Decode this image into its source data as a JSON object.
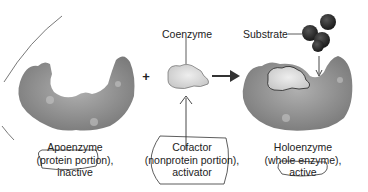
{
  "diagram": {
    "labels": {
      "coenzyme": "Coenzyme",
      "substrate": "Substrate",
      "plus": "+",
      "apoenzyme": {
        "line1": "Apoenzyme",
        "line2": "(protein portion),",
        "line3": "inactive"
      },
      "cofactor": {
        "line1": "Cofactor",
        "line2": "(nonprotein portion),",
        "line3": "activator"
      },
      "holoenzyme": {
        "line1": "Holoenzyme",
        "line2": "(whole enzyme),",
        "line3": "active"
      }
    },
    "colors": {
      "enzyme": "#8f8f8f",
      "cofactor": "#d9d9d9",
      "substrate": "#2e2e2e",
      "ink": "#333333"
    }
  }
}
